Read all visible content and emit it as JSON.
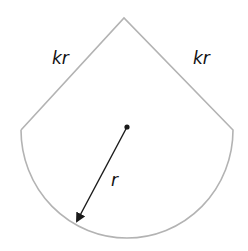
{
  "diagram": {
    "shape": "sector (kite-topped circle segment)",
    "labels": {
      "left_side": "kr",
      "right_side": "kr",
      "radius": "r"
    },
    "colors": {
      "outline": "#b3b3b3",
      "arrow": "#1a1a1a",
      "text": "#111111",
      "background": "#ffffff"
    }
  }
}
